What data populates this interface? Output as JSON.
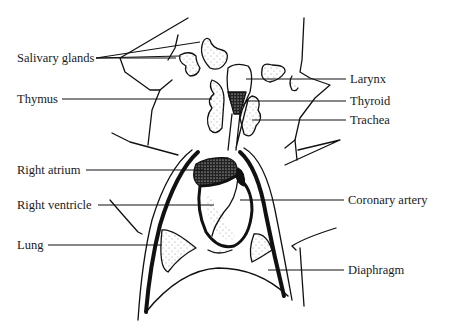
{
  "diagram": {
    "labels_left": [
      {
        "id": "salivary-glands",
        "text": "Salivary glands"
      },
      {
        "id": "thymus",
        "text": "Thymus"
      },
      {
        "id": "right-atrium",
        "text": "Right atrium"
      },
      {
        "id": "right-ventricle",
        "text": "Right ventricle"
      },
      {
        "id": "lung",
        "text": "Lung"
      }
    ],
    "labels_right": [
      {
        "id": "larynx",
        "text": "Larynx"
      },
      {
        "id": "thyroid",
        "text": "Thyroid"
      },
      {
        "id": "trachea",
        "text": "Trachea"
      },
      {
        "id": "coronary-artery",
        "text": "Coronary artery"
      },
      {
        "id": "diaphragm",
        "text": "Diaphragm"
      }
    ],
    "colors": {
      "ink": "#111111",
      "paper": "#ffffff"
    }
  }
}
